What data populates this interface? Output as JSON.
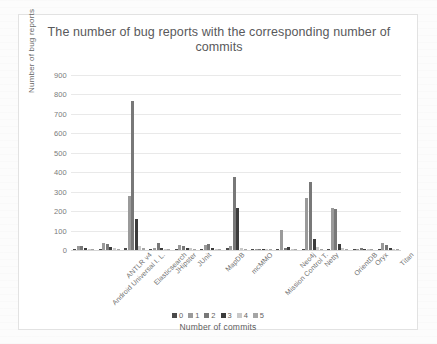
{
  "chart_data": {
    "type": "bar",
    "title": "The number of bug reports with the corresponding number of commits",
    "xlabel": "Number of commits",
    "ylabel": "Number of bug reports",
    "ylim": [
      0,
      900
    ],
    "ytick_step": 100,
    "yticks": [
      "900",
      "800",
      "700",
      "600",
      "500",
      "400",
      "300",
      "200",
      "100",
      "0"
    ],
    "grid": true,
    "legend_position": "bottom",
    "categories": [
      "Android Universal I. L.",
      "ANTLR v4",
      "Elasticsearch",
      "JHipster",
      "JUnit",
      "MapDB",
      "mcMMO",
      "Mission Control T.",
      "Neo4j",
      "Netty",
      "OrientDB",
      "Oryx",
      "Titan"
    ],
    "series": [
      {
        "name": "0",
        "color": "#4a4a4a",
        "values": [
          3,
          6,
          12,
          4,
          6,
          5,
          8,
          5,
          4,
          5,
          6,
          2,
          4
        ]
      },
      {
        "name": "1",
        "color": "#9a9a9a",
        "values": [
          22,
          34,
          280,
          8,
          28,
          25,
          20,
          7,
          105,
          265,
          215,
          4,
          38
        ]
      },
      {
        "name": "2",
        "color": "#787878",
        "values": [
          20,
          30,
          768,
          35,
          22,
          30,
          378,
          6,
          9,
          350,
          212,
          10,
          28
        ]
      },
      {
        "name": "3",
        "color": "#3c3c3c",
        "values": [
          8,
          14,
          160,
          12,
          12,
          12,
          215,
          4,
          14,
          55,
          30,
          3,
          10
        ]
      },
      {
        "name": "4",
        "color": "#c9c9c9",
        "values": [
          4,
          10,
          22,
          6,
          8,
          6,
          10,
          2,
          4,
          14,
          12,
          2,
          6
        ]
      },
      {
        "name": "5",
        "color": "#a5a5a5",
        "values": [
          2,
          4,
          8,
          3,
          4,
          3,
          5,
          1,
          2,
          5,
          5,
          1,
          3
        ]
      }
    ]
  },
  "legend": {
    "items": [
      "0",
      "1",
      "2",
      "3",
      "4",
      "5"
    ]
  }
}
